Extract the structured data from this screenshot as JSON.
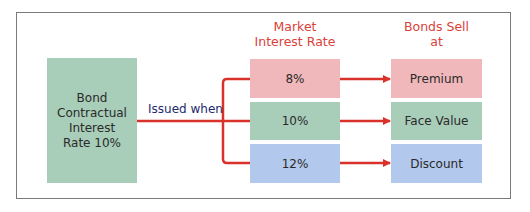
{
  "diagram": {
    "source_box": {
      "lines": [
        "Bond",
        "Contractual",
        "Interest",
        "Rate 10%"
      ]
    },
    "connector_label": "Issued when",
    "headers": {
      "market_rate": [
        "Market",
        "Interest Rate"
      ],
      "bonds_sell": [
        "Bonds Sell",
        "at"
      ]
    },
    "rows": [
      {
        "rate": "8%",
        "result": "Premium",
        "color": "#f1b8bb"
      },
      {
        "rate": "10%",
        "result": "Face Value",
        "color": "#a8cdb8"
      },
      {
        "rate": "12%",
        "result": "Discount",
        "color": "#b2c8ec"
      }
    ],
    "colors": {
      "connector": "#d9322b",
      "header_text": "#d9423a",
      "label_text": "#1e2a6e",
      "source_fill": "#a8cdb8",
      "frame": "#7a7a7a"
    }
  }
}
